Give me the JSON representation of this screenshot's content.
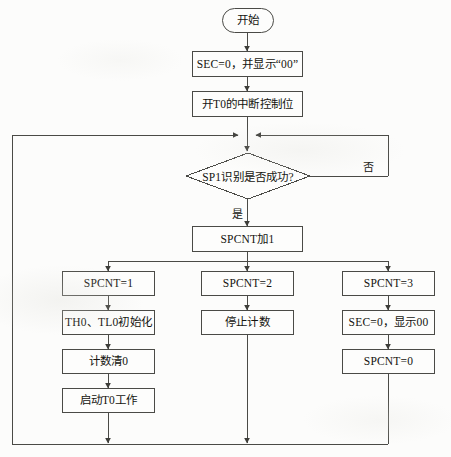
{
  "diagram": {
    "type": "flowchart",
    "language": "zh-CN",
    "colors": {
      "stroke": "#4a4a46",
      "text": "#14140f",
      "background": "#fcfcfb",
      "node_fill": "#fdfdfc"
    },
    "nodes": {
      "start": {
        "label": "开始",
        "shape": "terminal"
      },
      "init_sec": {
        "label": "SEC=0，并显示“00”",
        "shape": "process"
      },
      "enable_t0": {
        "label": "开T0的中断控制位",
        "shape": "process"
      },
      "decision": {
        "label": "SP1识别是否成功?",
        "shape": "decision"
      },
      "spcnt_inc": {
        "label": "SPCNT加1",
        "shape": "process"
      },
      "branch1_head": {
        "label": "SPCNT=1",
        "shape": "process"
      },
      "branch1_step1": {
        "label": "TH0、TL0初始化",
        "shape": "process"
      },
      "branch1_step2": {
        "label": "计数清0",
        "shape": "process"
      },
      "branch1_step3": {
        "label": "启动T0工作",
        "shape": "process"
      },
      "branch2_head": {
        "label": "SPCNT=2",
        "shape": "process"
      },
      "branch2_step1": {
        "label": "停止计数",
        "shape": "process"
      },
      "branch3_head": {
        "label": "SPCNT=3",
        "shape": "process"
      },
      "branch3_step1": {
        "label": "SEC=0，显示00",
        "shape": "process"
      },
      "branch3_step2": {
        "label": "SPCNT=0",
        "shape": "process"
      }
    },
    "edge_labels": {
      "decision_no": "否",
      "decision_yes": "是"
    }
  }
}
